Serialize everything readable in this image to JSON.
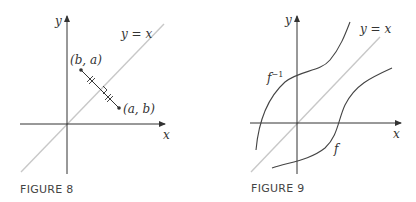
{
  "figures": [
    {
      "caption": "FIGURE 8",
      "labels": {
        "y_axis": "y",
        "x_axis": "x",
        "line": "y = x",
        "point_upper": "(b, a)",
        "point_lower": "(a, b)"
      }
    },
    {
      "caption": "FIGURE 9",
      "labels": {
        "y_axis": "y",
        "x_axis": "x",
        "line": "y = x",
        "curve_inverse": "f",
        "curve_inverse_sup": "−1",
        "curve_f": "f"
      }
    }
  ],
  "colors": {
    "axis": "#333333",
    "diagonal": "#c8c8c8",
    "curve": "#444444",
    "caption": "#444444"
  }
}
